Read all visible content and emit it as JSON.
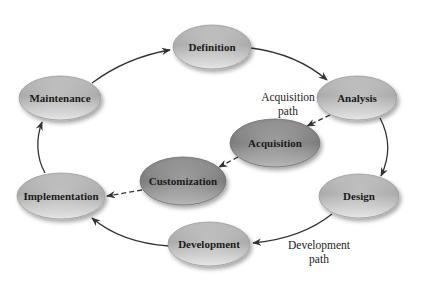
{
  "diagram": {
    "nodes": [
      {
        "id": "definition",
        "label": "Definition",
        "cx": 212,
        "cy": 47,
        "rx": 39,
        "ry": 22,
        "shade": "light"
      },
      {
        "id": "analysis",
        "label": "Analysis",
        "cx": 357,
        "cy": 98,
        "rx": 40,
        "ry": 22,
        "shade": "light"
      },
      {
        "id": "design",
        "label": "Design",
        "cx": 359,
        "cy": 196,
        "rx": 40,
        "ry": 22,
        "shade": "light"
      },
      {
        "id": "development",
        "label": "Development",
        "cx": 209,
        "cy": 244,
        "rx": 41,
        "ry": 22,
        "shade": "light"
      },
      {
        "id": "implementation",
        "label": "Implementation",
        "cx": 61,
        "cy": 196,
        "rx": 44,
        "ry": 23,
        "shade": "light"
      },
      {
        "id": "maintenance",
        "label": "Maintenance",
        "cx": 60,
        "cy": 98,
        "rx": 41,
        "ry": 22,
        "shade": "light"
      },
      {
        "id": "acquisition",
        "label": "Acquisition",
        "cx": 275,
        "cy": 143,
        "rx": 45,
        "ry": 24,
        "shade": "dark"
      },
      {
        "id": "customization",
        "label": "Customization",
        "cx": 183,
        "cy": 181,
        "rx": 43,
        "ry": 24,
        "shade": "dark"
      }
    ],
    "path_labels": {
      "acquisition_line1": "Acquisition",
      "acquisition_line2": "path",
      "development_line1": "Development",
      "development_line2": "path"
    },
    "edges": [
      {
        "from": "maintenance",
        "to": "definition",
        "style": "solid"
      },
      {
        "from": "definition",
        "to": "analysis",
        "style": "solid"
      },
      {
        "from": "analysis",
        "to": "design",
        "style": "solid"
      },
      {
        "from": "design",
        "to": "development",
        "style": "solid"
      },
      {
        "from": "development",
        "to": "implementation",
        "style": "solid"
      },
      {
        "from": "implementation",
        "to": "maintenance",
        "style": "solid"
      },
      {
        "from": "analysis",
        "to": "acquisition",
        "style": "dashed"
      },
      {
        "from": "acquisition",
        "to": "customization",
        "style": "dashed"
      },
      {
        "from": "customization",
        "to": "implementation",
        "style": "dashed"
      }
    ],
    "colors": {
      "light_node_top": "#c8c8c8",
      "light_node_mid": "#a8a8a8",
      "light_node_bottom": "#e4e4e4",
      "dark_node_top": "#9a9a9a",
      "dark_node_mid": "#7e7e7e",
      "dark_node_bottom": "#bdbdbd",
      "edge": "#333333"
    }
  }
}
